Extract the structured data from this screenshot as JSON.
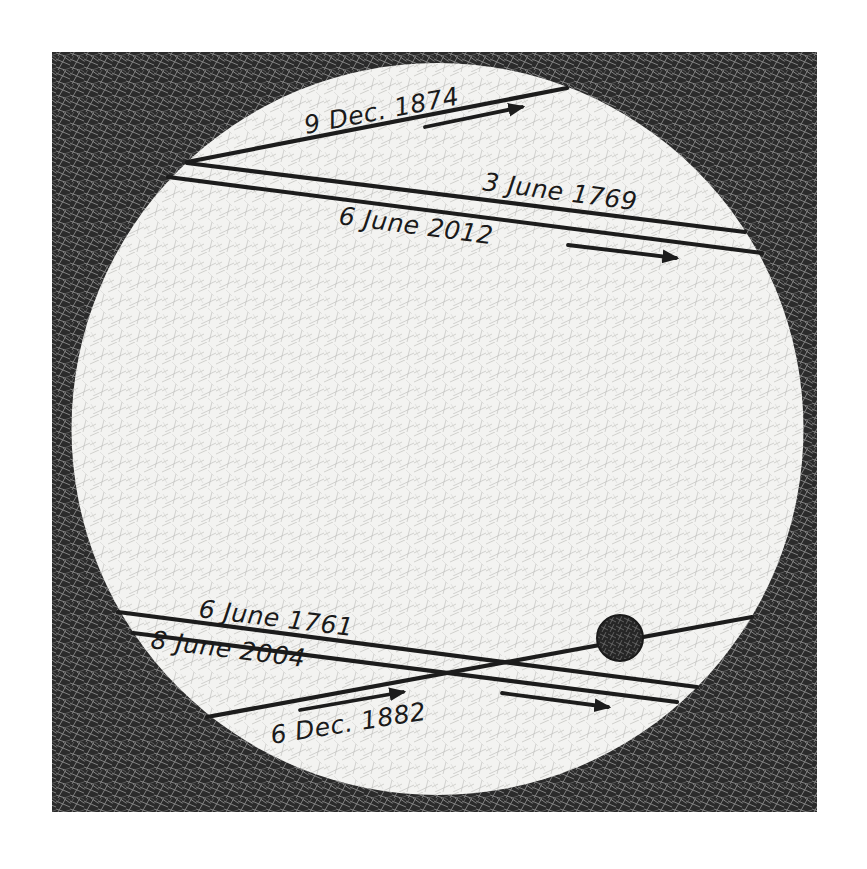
{
  "figure": {
    "colors": {
      "background_sky": "#2e2e2e",
      "sun_disc": "#f1f1ef",
      "track_line": "#1c1c1c",
      "venus_disc": "#2a2a2a",
      "page": "#ffffff"
    },
    "frame": {
      "x": 52,
      "y": 52,
      "width": 765,
      "height": 760
    },
    "sun": {
      "cx": 437.5,
      "cy": 429,
      "r": 366
    },
    "venus": {
      "cx": 620,
      "cy": 638,
      "r": 23
    },
    "transits": [
      {
        "id": "1874",
        "label": "9 Dec. 1874",
        "x1": 187,
        "y1": 162,
        "x2": 567,
        "y2": 88,
        "label_x": 306,
        "label_y": 134,
        "label_rotate": -11
      },
      {
        "id": "1769",
        "label": "3 June 1769",
        "x1": 187,
        "y1": 163,
        "x2": 745,
        "y2": 232,
        "label_x": 482,
        "label_y": 190,
        "label_rotate": 7.5
      },
      {
        "id": "2012",
        "label": "6 June 2012",
        "x1": 168,
        "y1": 177,
        "x2": 762,
        "y2": 253,
        "label_x": 338,
        "label_y": 224,
        "label_rotate": 7.5
      },
      {
        "id": "1761",
        "label": "6 June 1761",
        "x1": 118,
        "y1": 612,
        "x2": 697,
        "y2": 687,
        "label_x": 198,
        "label_y": 617,
        "label_rotate": 7
      },
      {
        "id": "2004",
        "label": "8 June 2004",
        "x1": 133,
        "y1": 633,
        "x2": 677,
        "y2": 702,
        "label_x": 150,
        "label_y": 648,
        "label_rotate": 7
      },
      {
        "id": "1882",
        "label": "6 Dec. 1882",
        "x1": 207,
        "y1": 717,
        "x2": 752,
        "y2": 617,
        "label_x": 272,
        "label_y": 744,
        "label_rotate": -9
      }
    ],
    "direction_arrows": [
      {
        "id": "arrow-1874",
        "x1": 425,
        "y1": 127,
        "x2": 522,
        "y2": 107
      },
      {
        "id": "arrow-2012",
        "x1": 568,
        "y1": 245,
        "x2": 676,
        "y2": 258
      },
      {
        "id": "arrow-2004",
        "x1": 502,
        "y1": 693,
        "x2": 608,
        "y2": 707
      },
      {
        "id": "arrow-1882",
        "x1": 300,
        "y1": 710,
        "x2": 403,
        "y2": 692
      }
    ]
  }
}
